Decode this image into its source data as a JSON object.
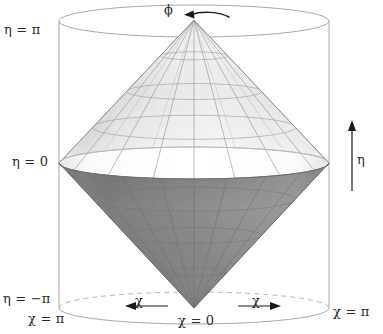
{
  "figure": {
    "background_color": "#ffffff",
    "labels": {
      "eta_pi": "η = π",
      "eta_zero": "η = 0",
      "eta_minus_pi": "η = −π",
      "chi_pi_left": "χ = π",
      "chi_pi_right": "χ = π",
      "chi_zero": "χ = 0",
      "chi_left_arrow": "χ",
      "chi_right_arrow": "χ",
      "phi": "ϕ",
      "eta_axis": "η"
    },
    "colors": {
      "outline": "#9a9a9a",
      "dashed_outline": "#b0b0b0",
      "upper_cone_light": "#f2f2f2",
      "upper_cone_mid": "#d9d9d9",
      "upper_cone_dark": "#b8b8b8",
      "lower_cone": "#8f8f8f",
      "lower_cone_dark": "#7a7a7a",
      "equator_band": "#ffffff",
      "grid": "#8c8c8c",
      "arrow": "#1a1a1a",
      "text": "#2a2a2a"
    },
    "geometry": {
      "cylinder_left_x": 59,
      "cylinder_right_x": 330,
      "cylinder_top_y": 21,
      "cylinder_bottom_y": 308,
      "ellipse_rx": 135,
      "ellipse_ry": 16,
      "center_x": 194,
      "apex_y": 20,
      "equator_y": 163,
      "bottom_vertex_y": 308
    }
  }
}
